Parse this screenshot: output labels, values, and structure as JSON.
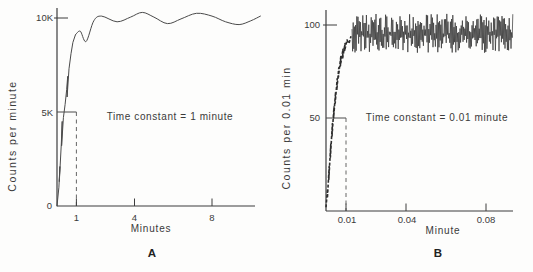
{
  "figure": {
    "background": "#fdfdfc",
    "ink": "#3a3a3a",
    "curve_color": "#4a4a4a"
  },
  "chart_data": [
    {
      "panel_label": "A",
      "type": "line",
      "title": "",
      "xlabel": "Minutes",
      "ylabel": "Counts per minute",
      "annotation": "Time constant = 1 minute",
      "xlim": [
        0,
        10.6
      ],
      "ylim": [
        0,
        10800
      ],
      "grid": false,
      "xticks": [
        {
          "value": 1,
          "label": "1"
        },
        {
          "value": 4,
          "label": "4"
        },
        {
          "value": 8,
          "label": "8"
        }
      ],
      "yticks": [
        {
          "value": 0,
          "label": "0"
        },
        {
          "value": 5000,
          "label": "5K"
        },
        {
          "value": 10000,
          "label": "10K"
        }
      ],
      "reference": {
        "x": 1,
        "y": 5000,
        "style": "horizontal-line-with-dashed-drop"
      },
      "series": [
        {
          "name": "meter-response-rise",
          "style": "jagged",
          "points": [
            [
              0,
              0
            ],
            [
              0.1,
              1000
            ],
            [
              0.15,
              2100
            ],
            [
              0.12,
              1300
            ],
            [
              0.22,
              3300
            ],
            [
              0.27,
              4500
            ],
            [
              0.24,
              3200
            ],
            [
              0.33,
              4700
            ],
            [
              0.42,
              5400
            ],
            [
              0.5,
              6200
            ],
            [
              0.55,
              6900
            ],
            [
              0.52,
              5800
            ],
            [
              0.62,
              7300
            ],
            [
              0.72,
              8100
            ],
            [
              0.82,
              8700
            ],
            [
              0.95,
              9100
            ]
          ]
        },
        {
          "name": "meter-response-plateau",
          "style": "smooth",
          "points": [
            [
              0.95,
              9100
            ],
            [
              1.2,
              9300
            ],
            [
              1.5,
              8750
            ],
            [
              1.9,
              9850
            ],
            [
              2.3,
              10100
            ],
            [
              3.1,
              9800
            ],
            [
              3.8,
              10050
            ],
            [
              4.4,
              10300
            ],
            [
              5.0,
              10050
            ],
            [
              5.7,
              9700
            ],
            [
              6.4,
              9950
            ],
            [
              7.2,
              10250
            ],
            [
              8.0,
              10100
            ],
            [
              8.7,
              9800
            ],
            [
              9.4,
              9650
            ],
            [
              10.0,
              9850
            ],
            [
              10.5,
              10100
            ]
          ]
        }
      ]
    },
    {
      "panel_label": "B",
      "type": "line",
      "title": "",
      "xlabel": "Minute",
      "ylabel": "Counts per 0.01 min",
      "annotation": "Time constant = 0.01 minute",
      "xlim": [
        0,
        0.095
      ],
      "ylim": [
        0,
        108
      ],
      "grid": false,
      "xticks": [
        {
          "value": 0.01,
          "label": "0.01"
        },
        {
          "value": 0.04,
          "label": "0.04"
        },
        {
          "value": 0.08,
          "label": "0.08"
        }
      ],
      "yticks": [
        {
          "value": 50,
          "label": "50"
        },
        {
          "value": 100,
          "label": "100"
        }
      ],
      "reference": {
        "x": 0.01,
        "y": 50,
        "style": "horizontal-line-with-dashed-drop"
      },
      "series": [
        {
          "name": "meter-response-rise",
          "style": "jagged-dashed",
          "points": [
            [
              0,
              2
            ],
            [
              0.0008,
              12
            ],
            [
              0.0007,
              7
            ],
            [
              0.0016,
              24
            ],
            [
              0.0014,
              17
            ],
            [
              0.0024,
              36
            ],
            [
              0.0022,
              29
            ],
            [
              0.0032,
              47
            ],
            [
              0.003,
              40
            ],
            [
              0.004,
              56
            ],
            [
              0.0038,
              50
            ],
            [
              0.0048,
              64
            ],
            [
              0.0046,
              58
            ],
            [
              0.0056,
              71
            ],
            [
              0.0054,
              65
            ],
            [
              0.0064,
              77
            ],
            [
              0.0062,
              72
            ],
            [
              0.0074,
              83
            ],
            [
              0.0072,
              78
            ],
            [
              0.0085,
              87
            ],
            [
              0.0083,
              82
            ],
            [
              0.0095,
              90
            ],
            [
              0.0093,
              86
            ],
            [
              0.0105,
              92
            ],
            [
              0.0115,
              90
            ],
            [
              0.0125,
              94
            ]
          ]
        },
        {
          "name": "noise-band",
          "style": "noise",
          "x_start": 0.013,
          "x_end": 0.0935,
          "step": 0.0003,
          "y_min": 85,
          "y_mid": 95,
          "y_max": 106,
          "seed": 42
        }
      ]
    }
  ]
}
